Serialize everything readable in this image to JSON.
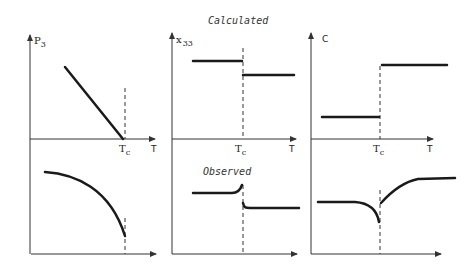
{
  "labels": {
    "calculated": "Calculated",
    "observed": "Observed",
    "p3": "P",
    "p3_sub": "3",
    "x33": "x",
    "x33_sub": "33",
    "c": "C",
    "tc": "T",
    "tc_sub": "c",
    "t": "T"
  },
  "panels": [
    {
      "name": "polarization",
      "y_label": "P3",
      "calculated": "linear decrease to zero at Tc",
      "observed": "concave curve dropping to zero at Tc"
    },
    {
      "name": "susceptibility",
      "y_label": "x33",
      "calculated": "step down at Tc",
      "observed": "peak before Tc then lower plateau"
    },
    {
      "name": "elastic-constant",
      "y_label": "C",
      "calculated": "step up at Tc",
      "observed": "dip at Tc then rise to plateau"
    }
  ],
  "colors": {
    "ink": "#1a1a1a",
    "background": "#ffffff"
  }
}
